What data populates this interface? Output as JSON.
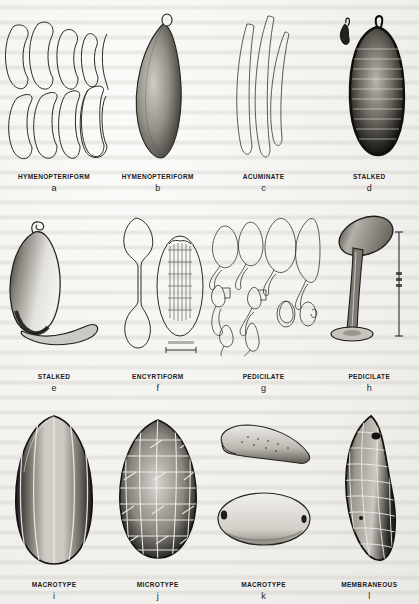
{
  "figure": {
    "background_color": "#f2f1ee",
    "ink_color": "#1c1b19",
    "rows": 3,
    "columns": 4
  },
  "panels": [
    {
      "letter": "a",
      "type": "HYMENOPTERIFORM",
      "art_name": "hymenopteriform-egg-outlines",
      "description": "Two rows of five elongate outline egg shapes, unshaded line drawings"
    },
    {
      "letter": "b",
      "type": "HYMENOPTERIFORM",
      "art_name": "hymenopteriform-egg-stippled",
      "description": "Single elongate fusiform egg, stippled shading, small knob at top"
    },
    {
      "letter": "c",
      "type": "ACUMINATE",
      "art_name": "acuminate-egg-outlines",
      "description": "Three slender tapering sickle-shaped eggs drawn in outline"
    },
    {
      "letter": "d",
      "type": "STALKED",
      "art_name": "stalked-egg-ridged",
      "description": "Dark heavily ridged ovoid egg with short apical stalk; detached pedicel at upper left"
    },
    {
      "letter": "e",
      "type": "STALKED",
      "art_name": "stalked-egg-long-pedicel",
      "description": "Ovoid shaded egg with long curving pedicel extending to the right"
    },
    {
      "letter": "f",
      "type": "ENCYRTIFORM",
      "art_name": "encyrtiform-egg-pair",
      "description": "Dumbbell-shaped encyrtiform egg beside an oval egg showing internal structure and a scale bar"
    },
    {
      "letter": "g",
      "type": "PEDICILATE",
      "art_name": "pedicilate-egg-outlines",
      "description": "Group of outline eggs with short curved pedicels, various orientations and sizes"
    },
    {
      "letter": "h",
      "type": "PEDICILATE",
      "art_name": "pedicilate-egg-tall-stalk",
      "description": "Stippled oval egg atop a tall tapering stalk with basal disc; vertical scale bar at right"
    },
    {
      "letter": "i",
      "type": "MACROTYPE",
      "art_name": "macrotype-egg-ribbed",
      "description": "Large ovoid egg with longitudinal ribs and dark lateral shading"
    },
    {
      "letter": "j",
      "type": "MICROTYPE",
      "art_name": "microtype-egg-reticulate",
      "description": "Ovoid egg with coarse polygonal reticulate sculpturing"
    },
    {
      "letter": "k",
      "type": "MACROTYPE",
      "art_name": "macrotype-egg-two-views",
      "description": "Two views: curved crescentic egg above, broad oval egg below, both lightly stippled"
    },
    {
      "letter": "l",
      "type": "MEMBRANEOUS",
      "art_name": "membraneous-egg-reticulate",
      "description": "Elongate curved egg with fine polygonal membrane sculpturing and dark margins"
    }
  ]
}
